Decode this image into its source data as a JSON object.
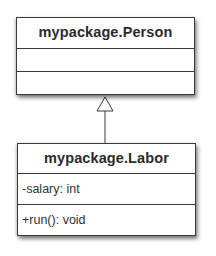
{
  "diagram": {
    "type": "uml-class-diagram",
    "classes": [
      {
        "id": "person",
        "name": "mypackage.Person",
        "attributes": [],
        "operations": []
      },
      {
        "id": "labor",
        "name": "mypackage.Labor",
        "attributes": [
          "-salary: int"
        ],
        "operations": [
          "+run(): void"
        ]
      }
    ],
    "relationships": [
      {
        "type": "generalization",
        "from": "mypackage.Labor",
        "to": "mypackage.Person"
      }
    ],
    "colors": {
      "border": "#3a3a3a",
      "text": "#2b2b2b",
      "background": "#ffffff"
    }
  }
}
